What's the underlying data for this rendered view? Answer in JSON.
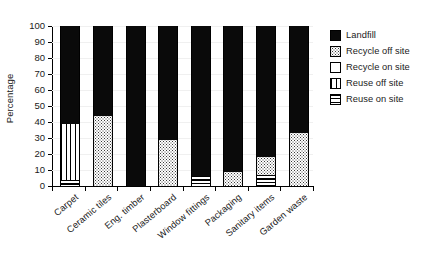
{
  "chart_data": {
    "type": "bar",
    "subtype": "stacked-percentage",
    "title": "",
    "xlabel": "",
    "ylabel": "Percentage",
    "ylim": [
      0,
      100
    ],
    "ytick_step": 10,
    "yticks": [
      100,
      90,
      80,
      70,
      60,
      50,
      40,
      30,
      20,
      10,
      0
    ],
    "grid": true,
    "legend_position": "right",
    "categories": [
      "Carpet",
      "Ceramic tiles",
      "Eng. timber",
      "Plasterboard",
      "Window fittings",
      "Packaging",
      "Sanitary items",
      "Garden waste"
    ],
    "series": [
      {
        "name": "Reuse on site",
        "pattern": "horizontal-lines",
        "values": [
          4,
          0,
          0,
          0,
          6,
          0,
          7,
          0
        ]
      },
      {
        "name": "Reuse off site",
        "pattern": "vertical-lines",
        "values": [
          35,
          0,
          0,
          0,
          0,
          0,
          0,
          0
        ]
      },
      {
        "name": "Recycle on site",
        "pattern": "white",
        "values": [
          0,
          0,
          0,
          0,
          0,
          0,
          0,
          0
        ]
      },
      {
        "name": "Recycle off site",
        "pattern": "dotted",
        "values": [
          0,
          44,
          0,
          29,
          0,
          9,
          11,
          33
        ]
      },
      {
        "name": "Landfill",
        "pattern": "solid-black",
        "values": [
          61,
          56,
          100,
          71,
          94,
          91,
          82,
          67
        ]
      }
    ]
  },
  "legend": {
    "items": [
      {
        "label": "Landfill",
        "pattern_class": "pat-landfill",
        "icon": "legend-swatch-solid"
      },
      {
        "label": "Recycle off site",
        "pattern_class": "pat-recycle-off",
        "icon": "legend-swatch-dotted"
      },
      {
        "label": "Recycle on site",
        "pattern_class": "pat-recycle-on",
        "icon": "legend-swatch-white"
      },
      {
        "label": "Reuse off site",
        "pattern_class": "pat-reuse-off",
        "icon": "legend-swatch-vertical-lines"
      },
      {
        "label": "Reuse on site",
        "pattern_class": "pat-reuse-on",
        "icon": "legend-swatch-horizontal-lines"
      }
    ]
  },
  "colors": {
    "landfill": "#0a0a0a",
    "axis": "#000000",
    "grid": "#f0f0f0",
    "text": "#1a1a1a",
    "background": "#ffffff"
  }
}
